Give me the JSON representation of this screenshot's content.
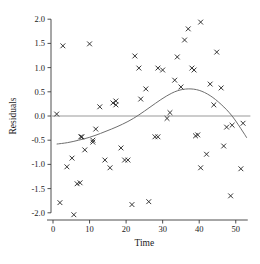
{
  "chart_data": {
    "type": "scatter",
    "title": "",
    "xlabel": "Time",
    "ylabel": "Residuals",
    "xlim": [
      -1,
      55
    ],
    "ylim": [
      -2.15,
      2.1
    ],
    "xticks": [
      0,
      10,
      20,
      30,
      40,
      50
    ],
    "xtick_labels": [
      "0",
      "10",
      "20",
      "30",
      "40",
      "50"
    ],
    "yticks": [
      -2.0,
      -1.5,
      -1.0,
      -0.5,
      0.0,
      0.5,
      1.0,
      1.5,
      2.0
    ],
    "ytick_labels": [
      "-2.0",
      "-1.5",
      "-1.0",
      "-0.5",
      "0.0",
      "0.5",
      "1.0",
      "1.5",
      "2.0"
    ],
    "grid": false,
    "legend": null,
    "marker": "x",
    "marker_color": "#2b2b2b",
    "reference_line": {
      "type": "horizontal",
      "y": 0.0,
      "color": "#9a9a9a",
      "x_start": 1,
      "x_end": 54
    },
    "fit_curve": {
      "name": "smoothed fit",
      "color": "#6e6e6e",
      "x": [
        1,
        4,
        7,
        10,
        13,
        16,
        19,
        22,
        25,
        28,
        31,
        34,
        37,
        40,
        43,
        46,
        49,
        52,
        53
      ],
      "y": [
        -0.58,
        -0.55,
        -0.5,
        -0.44,
        -0.36,
        -0.27,
        -0.17,
        -0.05,
        0.1,
        0.26,
        0.41,
        0.52,
        0.56,
        0.53,
        0.42,
        0.24,
        0.0,
        -0.33,
        -0.45
      ]
    },
    "points": [
      {
        "x": 1.0,
        "y": 0.04
      },
      {
        "x": 1.9,
        "y": -1.79
      },
      {
        "x": 2.7,
        "y": 1.45
      },
      {
        "x": 3.8,
        "y": -1.05
      },
      {
        "x": 5.2,
        "y": -0.87
      },
      {
        "x": 5.7,
        "y": -2.04
      },
      {
        "x": 6.6,
        "y": -1.4
      },
      {
        "x": 7.4,
        "y": -1.38
      },
      {
        "x": 7.6,
        "y": -0.43
      },
      {
        "x": 7.9,
        "y": -0.43
      },
      {
        "x": 8.7,
        "y": -0.7
      },
      {
        "x": 10.0,
        "y": 1.49
      },
      {
        "x": 10.9,
        "y": -0.5
      },
      {
        "x": 10.9,
        "y": -0.54
      },
      {
        "x": 11.7,
        "y": -0.27
      },
      {
        "x": 12.8,
        "y": 0.19
      },
      {
        "x": 14.2,
        "y": -0.91
      },
      {
        "x": 15.6,
        "y": -1.07
      },
      {
        "x": 16.4,
        "y": 0.27
      },
      {
        "x": 17.2,
        "y": 0.31
      },
      {
        "x": 17.2,
        "y": 0.23
      },
      {
        "x": 18.6,
        "y": -0.66
      },
      {
        "x": 19.6,
        "y": -0.91
      },
      {
        "x": 20.5,
        "y": -0.91
      },
      {
        "x": 21.6,
        "y": -1.83
      },
      {
        "x": 22.4,
        "y": 1.24
      },
      {
        "x": 23.5,
        "y": 0.99
      },
      {
        "x": 24.0,
        "y": 0.35
      },
      {
        "x": 25.4,
        "y": 0.56
      },
      {
        "x": 26.2,
        "y": -1.77
      },
      {
        "x": 27.9,
        "y": -0.43
      },
      {
        "x": 28.7,
        "y": -0.43
      },
      {
        "x": 28.7,
        "y": 0.99
      },
      {
        "x": 30.0,
        "y": 0.95
      },
      {
        "x": 31.2,
        "y": -0.05
      },
      {
        "x": 32.0,
        "y": 0.07
      },
      {
        "x": 33.3,
        "y": 0.74
      },
      {
        "x": 34.0,
        "y": 1.22
      },
      {
        "x": 35.0,
        "y": 0.6
      },
      {
        "x": 36.0,
        "y": 1.57
      },
      {
        "x": 37.0,
        "y": 1.8
      },
      {
        "x": 38.0,
        "y": 0.99
      },
      {
        "x": 38.6,
        "y": 0.95
      },
      {
        "x": 39.0,
        "y": -0.41
      },
      {
        "x": 39.6,
        "y": -0.39
      },
      {
        "x": 40.4,
        "y": 1.94
      },
      {
        "x": 40.4,
        "y": -1.07
      },
      {
        "x": 42.0,
        "y": -0.79
      },
      {
        "x": 43.0,
        "y": 0.66
      },
      {
        "x": 44.0,
        "y": 0.23
      },
      {
        "x": 44.8,
        "y": 1.32
      },
      {
        "x": 46.0,
        "y": 0.58
      },
      {
        "x": 46.7,
        "y": -0.62
      },
      {
        "x": 47.5,
        "y": -0.23
      },
      {
        "x": 48.6,
        "y": -1.65
      },
      {
        "x": 49.0,
        "y": -0.19
      },
      {
        "x": 51.4,
        "y": -1.09
      },
      {
        "x": 52.0,
        "y": -0.15
      }
    ]
  }
}
